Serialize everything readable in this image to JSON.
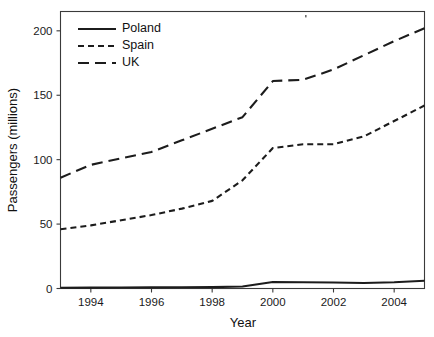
{
  "chart_data": {
    "type": "line",
    "title": "",
    "subtitle": "",
    "xlabel": "Year",
    "ylabel": "Passengers (millions)",
    "xlim": [
      1993,
      2005
    ],
    "ylim": [
      0,
      215
    ],
    "yticks": [
      0,
      50,
      100,
      150,
      200
    ],
    "ytick_labels": [
      "0",
      "50",
      "100",
      "150",
      "200"
    ],
    "xticks": [
      1994,
      1996,
      1998,
      2000,
      2002,
      2004
    ],
    "xtick_labels": [
      "1994",
      "1996",
      "1998",
      "2000",
      "2002",
      "2004"
    ],
    "grid": false,
    "legend_position": "upper left",
    "x": [
      1993,
      1994,
      1995,
      1996,
      1997,
      1998,
      1999,
      2000,
      2001,
      2002,
      2003,
      2004,
      2005
    ],
    "series": [
      {
        "name": "Poland",
        "style": "solid",
        "values": [
          0.6,
          0.7,
          0.8,
          0.9,
          1.0,
          1.1,
          1.6,
          5.0,
          4.9,
          4.6,
          4.3,
          4.8,
          6.0
        ]
      },
      {
        "name": "Spain",
        "style": "dashed",
        "values": [
          46,
          49,
          53,
          57,
          62,
          68,
          84,
          109,
          112,
          112,
          118,
          130,
          142
        ]
      },
      {
        "name": "UK",
        "style": "long-dashed",
        "values": [
          86,
          96,
          101,
          106,
          115,
          124,
          133,
          161,
          162,
          170,
          181,
          192,
          202
        ]
      }
    ]
  },
  "legend": {
    "entries": [
      {
        "label": "Poland",
        "style": "solid"
      },
      {
        "label": "Spain",
        "style": "dashed"
      },
      {
        "label": "UK",
        "style": "long-dashed"
      }
    ]
  },
  "colors": {
    "background": "#ffffff",
    "axis": "#3a3a3a",
    "line": "#1c1c1c",
    "text": "#111111"
  }
}
